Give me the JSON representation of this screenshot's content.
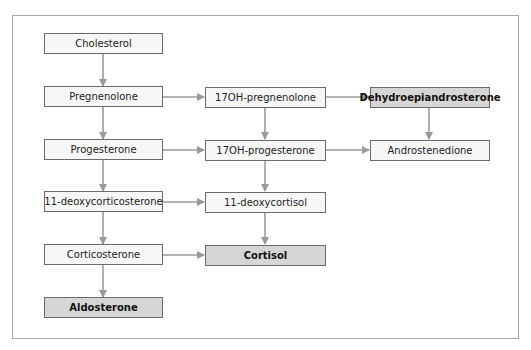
{
  "diagram": {
    "type": "flowchart",
    "colors": {
      "box_fill": "#f7f7f7",
      "highlight_fill": "#d6d6d6",
      "border": "#6a6a6a",
      "arrow": "#9a9a9a",
      "frame": "#a8a8a8"
    },
    "nodes": {
      "cholesterol": {
        "label": "Cholesterol",
        "highlight": false
      },
      "pregnenolone": {
        "label": "Pregnenolone",
        "highlight": false
      },
      "oh17_pregnenolone": {
        "label": "17OH-pregnenolone",
        "highlight": false
      },
      "dhea": {
        "label": "Dehydroepiandrosterone",
        "highlight": true
      },
      "progesterone": {
        "label": "Progesterone",
        "highlight": false
      },
      "oh17_progesterone": {
        "label": "17OH-progesterone",
        "highlight": false
      },
      "androstenedione": {
        "label": "Androstenedione",
        "highlight": false
      },
      "deoxycorticosterone": {
        "label": "11-deoxycorticosterone",
        "highlight": false
      },
      "deoxycortisol": {
        "label": "11-deoxycortisol",
        "highlight": false
      },
      "corticosterone": {
        "label": "Corticosterone",
        "highlight": false
      },
      "cortisol": {
        "label": "Cortisol",
        "highlight": true
      },
      "aldosterone": {
        "label": "Aldosterone",
        "highlight": true
      }
    },
    "edges": [
      [
        "Cholesterol",
        "Pregnenolone"
      ],
      [
        "Pregnenolone",
        "17OH-pregnenolone"
      ],
      [
        "17OH-pregnenolone",
        "Dehydroepiandrosterone"
      ],
      [
        "Pregnenolone",
        "Progesterone"
      ],
      [
        "17OH-pregnenolone",
        "17OH-progesterone"
      ],
      [
        "Dehydroepiandrosterone",
        "Androstenedione"
      ],
      [
        "Progesterone",
        "17OH-progesterone"
      ],
      [
        "17OH-progesterone",
        "Androstenedione"
      ],
      [
        "Progesterone",
        "11-deoxycorticosterone"
      ],
      [
        "17OH-progesterone",
        "11-deoxycortisol"
      ],
      [
        "11-deoxycorticosterone",
        "11-deoxycortisol"
      ],
      [
        "11-deoxycorticosterone",
        "Corticosterone"
      ],
      [
        "11-deoxycortisol",
        "Cortisol"
      ],
      [
        "Corticosterone",
        "Cortisol"
      ],
      [
        "Corticosterone",
        "Aldosterone"
      ]
    ]
  }
}
